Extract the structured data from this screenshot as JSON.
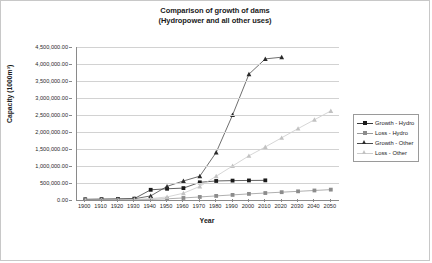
{
  "chart_data": {
    "type": "line",
    "title": "Comparison of growth of dams\n(Hydropower and all other uses)",
    "title_line1": "Comparison of growth of dams",
    "title_line2": "(Hydropower and all other uses)",
    "xlabel": "Year",
    "ylabel": "Capacity (1000m³)",
    "x": [
      1900,
      1910,
      1920,
      1930,
      1940,
      1950,
      1960,
      1970,
      1980,
      1990,
      2000,
      2010,
      2020,
      2030,
      2040,
      2050
    ],
    "xlim": [
      1895,
      2055
    ],
    "ylim": [
      0,
      4500000
    ],
    "ytick_values": [
      0,
      500000,
      1000000,
      1500000,
      2000000,
      2500000,
      3000000,
      3500000,
      4000000,
      4500000
    ],
    "ytick_labels": [
      "0.00",
      "500,000.00",
      "1,000,000.00",
      "1,500,000.00",
      "2,000,000.00",
      "2,500,000.00",
      "3,000,000.00",
      "3,500,000.00",
      "4,000,000.00",
      "4,500,000.00"
    ],
    "xtick_labels": [
      "1900",
      "1910",
      "1920",
      "1930",
      "1940",
      "1950",
      "1960",
      "1970",
      "1980",
      "1990",
      "2000",
      "2010",
      "2020",
      "2030",
      "2040",
      "2050"
    ],
    "grid": true,
    "legend_position": "right-outside",
    "series": [
      {
        "name": "Growth - Hydro",
        "marker": "square",
        "color": "#1a1a1a",
        "line_color": "#3a3a3a",
        "values": [
          20000,
          25000,
          30000,
          40000,
          300000,
          330000,
          350000,
          520000,
          560000,
          570000,
          575000,
          578000,
          null,
          null,
          null,
          null
        ]
      },
      {
        "name": "Loss - Hydro",
        "marker": "square",
        "color": "#8c8c8c",
        "line_color": "#9a9a9a",
        "values": [
          2000,
          4000,
          6000,
          10000,
          20000,
          35000,
          60000,
          90000,
          120000,
          150000,
          180000,
          205000,
          230000,
          255000,
          280000,
          305000
        ]
      },
      {
        "name": "Growth - Other",
        "marker": "triangle",
        "color": "#2a2a2a",
        "line_color": "#4a4a4a",
        "values": [
          15000,
          20000,
          25000,
          35000,
          120000,
          400000,
          560000,
          700000,
          1400000,
          2500000,
          3700000,
          4150000,
          4200000,
          null,
          null,
          null
        ]
      },
      {
        "name": "Loss - Other",
        "marker": "triangle",
        "color": "#c2c2c2",
        "line_color": "#cccccc",
        "values": [
          3000,
          5000,
          8000,
          15000,
          40000,
          90000,
          200000,
          400000,
          700000,
          1000000,
          1300000,
          1560000,
          1830000,
          2100000,
          2360000,
          2620000
        ]
      }
    ]
  },
  "legend": {
    "items": [
      {
        "label": "Growth - Hydro"
      },
      {
        "label": "Loss - Hydro"
      },
      {
        "label": "Growth - Other"
      },
      {
        "label": "Loss - Other"
      }
    ]
  }
}
